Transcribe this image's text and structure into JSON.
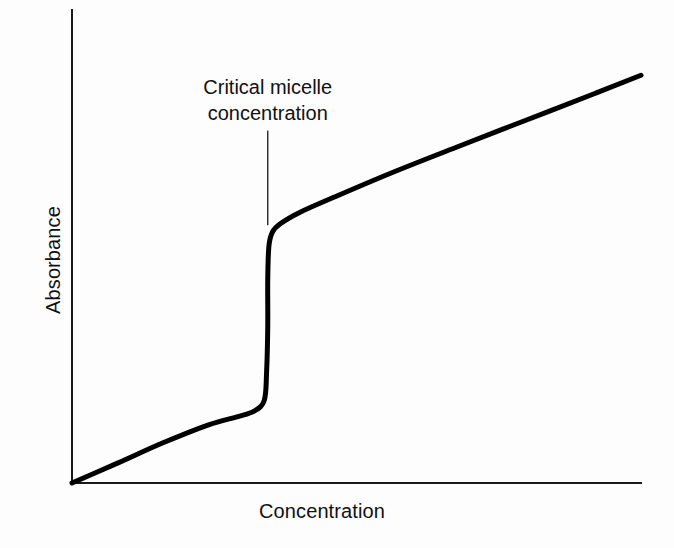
{
  "figure": {
    "background_color": "#fdfdfd",
    "ink_color": "#111111"
  },
  "chart_data": {
    "type": "line",
    "title": "",
    "subtitle": "",
    "xlabel": "Concentration",
    "ylabel": "Absorbance",
    "xlim": [
      0,
      1
    ],
    "ylim": [
      0,
      1
    ],
    "grid": false,
    "legend": null,
    "axis_ticks": {
      "x": [],
      "y": []
    },
    "series": [
      {
        "name": "Absorbance vs concentration",
        "color": "#000000",
        "line_width": 5,
        "x": [
          0.0,
          0.08,
          0.16,
          0.24,
          0.29,
          0.32,
          0.338,
          0.342,
          0.344,
          0.344,
          0.346,
          0.352,
          0.366,
          0.4,
          0.46,
          0.56,
          0.68,
          0.8,
          0.92,
          1.0
        ],
        "y": [
          0.0,
          0.042,
          0.085,
          0.123,
          0.14,
          0.152,
          0.175,
          0.235,
          0.33,
          0.43,
          0.5,
          0.53,
          0.548,
          0.572,
          0.604,
          0.655,
          0.712,
          0.768,
          0.824,
          0.862
        ]
      }
    ],
    "annotations": [
      {
        "name": "cmc-annotation",
        "text": "Critical micelle\nconcentration",
        "lines": [
          "Critical micelle",
          "concentration"
        ],
        "x": 0.344,
        "pointer": {
          "type": "vertical-line",
          "x": 0.344,
          "y_top": 0.745,
          "y_bottom": 0.545,
          "line_width": 1.5,
          "color": "#333333"
        }
      }
    ]
  },
  "axes": {
    "y_axis_label": "Absorbance",
    "x_axis_label": "Concentration",
    "line_color": "#1a1a1a",
    "line_width": 2
  }
}
